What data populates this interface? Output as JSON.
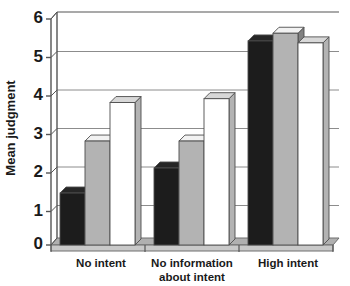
{
  "chart_data": {
    "type": "bar",
    "title": "",
    "subtitle": "",
    "xlabel": "",
    "ylabel": "Mean judgment",
    "categories": [
      "No intent",
      "No information about intent",
      "High intent"
    ],
    "category_lines": [
      [
        "No intent"
      ],
      [
        "No information",
        "about intent"
      ],
      [
        "High intent"
      ]
    ],
    "ylim": [
      0,
      6
    ],
    "yticks": [
      0,
      1,
      2,
      3,
      4,
      5,
      6
    ],
    "ytick_labels": [
      "0",
      "1",
      "2",
      "3",
      "4",
      "5",
      "6"
    ],
    "grid": true,
    "grid_axis": "y",
    "legend": "none",
    "style": "3d-grouped-bars",
    "series": [
      {
        "name": "Series 1",
        "color": "#1c1c1c",
        "values": [
          1.35,
          2.0,
          5.3
        ]
      },
      {
        "name": "Series 2",
        "color": "#b3b3b3",
        "values": [
          2.7,
          2.7,
          5.5
        ]
      },
      {
        "name": "Series 3",
        "color": "#ffffff",
        "values": [
          3.7,
          3.8,
          5.25
        ]
      }
    ]
  },
  "colors": {
    "series_1": "#1c1c1c",
    "series_2": "#b3b3b3",
    "series_3": "#ffffff",
    "axis": "#3a3a3a",
    "grid": "#8c8c8c",
    "text": "#1a1a1a",
    "floor": "#b0b0b0",
    "side_shade": "#8f8f8f"
  }
}
